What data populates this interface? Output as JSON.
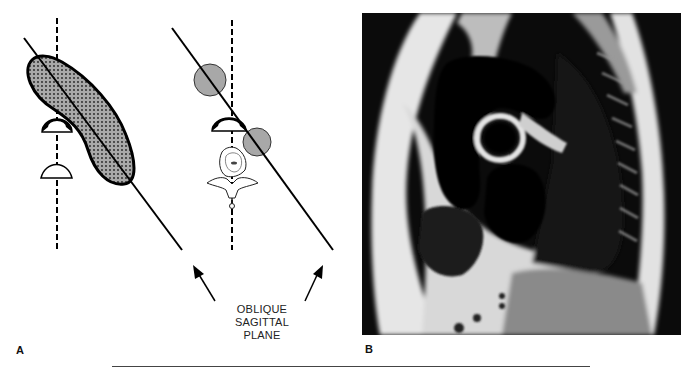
{
  "figure": {
    "panel_a": {
      "label": "A",
      "annotation": [
        "OBLIQUE",
        "SAGITTAL",
        "PLANE"
      ],
      "left_schematic": {
        "elements": [
          "dashed-midline",
          "oblique-plane-line",
          "dotted-oblong-structure",
          "black-half-dome",
          "white-half-dome"
        ]
      },
      "right_schematic": {
        "elements": [
          "dashed-midline",
          "oblique-plane-line",
          "gray-circle-upper",
          "gray-circle-lower",
          "black-half-dome",
          "vertebra"
        ]
      }
    },
    "panel_b": {
      "label": "B",
      "description": "Oblique sagittal MRI of the chest"
    }
  },
  "colors": {
    "background": "#ffffff",
    "line": "#000000",
    "shape_fill": "#a8a8a8",
    "mri_dark": "#0a0a0a",
    "mri_bright": "#e8e8e8",
    "rule": "#444444"
  }
}
